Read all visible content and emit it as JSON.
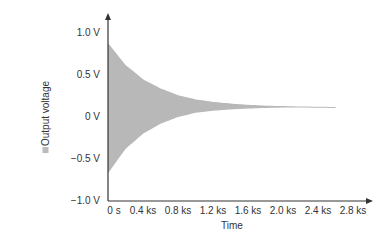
{
  "chart_data": {
    "type": "area",
    "title": "",
    "xlabel": "Time",
    "ylabel": "Output voltage",
    "x_tick_labels": [
      "0 s",
      "0.4 ks",
      "0.8 ks",
      "1.2 ks",
      "1.6 ks",
      "2.0 ks",
      "2.4 ks",
      "2.8 ks"
    ],
    "x_ticks": [
      0,
      400,
      800,
      1200,
      1600,
      2000,
      2400,
      2800
    ],
    "y_tick_labels": [
      "1.0 V",
      "0.5 V",
      "0 V",
      "-0.5 V",
      "-1.0 V"
    ],
    "y_ticks": [
      1.0,
      0.5,
      0.0,
      -0.5,
      -1.0
    ],
    "xlim": [
      0,
      2900
    ],
    "ylim": [
      -1.0,
      1.1
    ],
    "grid": false,
    "legend": null,
    "series": [
      {
        "name": "Output voltage envelope (upper)",
        "x": [
          0,
          200,
          400,
          600,
          800,
          1000,
          1200,
          1400,
          1600,
          1800,
          2000,
          2200,
          2400,
          2600
        ],
        "values": [
          0.88,
          0.62,
          0.45,
          0.34,
          0.26,
          0.21,
          0.18,
          0.16,
          0.145,
          0.135,
          0.13,
          0.125,
          0.122,
          0.12
        ]
      },
      {
        "name": "Output voltage envelope (lower)",
        "x": [
          0,
          200,
          400,
          600,
          800,
          1000,
          1200,
          1400,
          1600,
          1800,
          2000,
          2200,
          2400,
          2600
        ],
        "values": [
          -0.67,
          -0.38,
          -0.2,
          -0.08,
          0.0,
          0.05,
          0.075,
          0.09,
          0.1,
          0.108,
          0.112,
          0.115,
          0.118,
          0.12
        ]
      }
    ],
    "fill_color": "#b8b8b8",
    "axis_color": "#333333"
  }
}
